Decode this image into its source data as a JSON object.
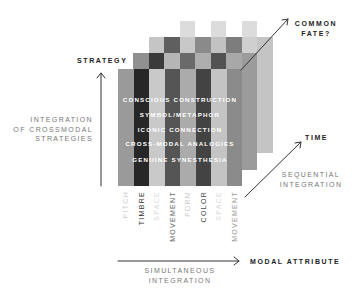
{
  "axes": {
    "strategy": {
      "label": "STRATEGY",
      "description": [
        "INTEGRATION",
        "OF CROSSMODAL",
        "STRATEGIES"
      ]
    },
    "modal_attribute": {
      "label": "MODAL ATTRIBUTE",
      "description": [
        "SIMULTANEOUS",
        "INTEGRATION"
      ]
    },
    "time": {
      "label": "TIME",
      "description": [
        "SEQUENTIAL",
        "INTEGRATION"
      ]
    },
    "common_fate": {
      "label": [
        "COMMON",
        "FATE?"
      ]
    }
  },
  "strategies": [
    "CONSCIOUS CONSTRUCTION",
    "SYMBOL/METAPHOR",
    "ICONIC CONNECTION",
    "CROSS-MODAL ANALOGIES",
    "GENUINE SYNESTHESIA"
  ],
  "attributes": [
    {
      "label": "PITCH",
      "color": "#cfcfcf"
    },
    {
      "label": "TIMBRE",
      "color": "#333333"
    },
    {
      "label": "SPACE",
      "color": "#dadada"
    },
    {
      "label": "MOVEMENT",
      "color": "#666666"
    },
    {
      "label": "FORM",
      "color": "#cccccc"
    },
    {
      "label": "COLOR",
      "color": "#444444"
    },
    {
      "label": "SPACE",
      "color": "#dadada"
    },
    {
      "label": "MOVEMENT",
      "color": "#999999"
    }
  ],
  "grid": {
    "layer_front": [
      "#9a9a9a",
      "#272727",
      "#c9c9c9",
      "#555555",
      "#ababab",
      "#434343",
      "#c4c4c4",
      "#8b8b8b"
    ],
    "layer_2": [
      "#909090",
      "#3a3a3a",
      "#b5b5b5",
      "#6a6a6a",
      "#aeaeae",
      "#525252",
      "#a8a8a8",
      "#9b9b9b"
    ],
    "layer_3": [
      "#c5c5c5",
      "#5f5f5f",
      "#c8c8c8",
      "#8a8a8a",
      "#c2c2c2",
      "#7d7d7d",
      "#cfcfcf",
      "#c4c4c4"
    ],
    "layer_4": [
      "#dcdcdc",
      "#dcdcdc",
      "#dcdcdc"
    ]
  },
  "colors": {
    "arrow": "#333333",
    "label_text": "#222222",
    "description_text": "#777777",
    "strategy_text": "#ffffff"
  }
}
